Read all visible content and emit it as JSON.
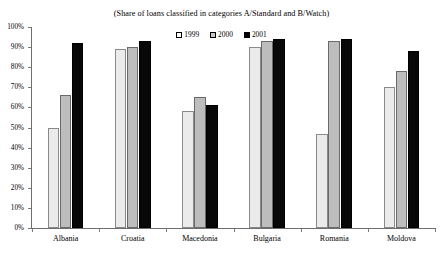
{
  "chart_data": {
    "type": "bar",
    "title": "(Share of loans classified in categories A/Standard and B/Watch)",
    "xlabel": "",
    "ylabel": "",
    "ylim": [
      0,
      100
    ],
    "ytick_labels": [
      "100%",
      "90%",
      "80%",
      "70%",
      "60%",
      "50%",
      "40%",
      "30%",
      "20%",
      "10%",
      "0%"
    ],
    "ytick_values": [
      100,
      90,
      80,
      70,
      60,
      50,
      40,
      30,
      20,
      10,
      0
    ],
    "grid": false,
    "legend_position": "top-center",
    "categories": [
      "Albania",
      "Croatia",
      "Macedonia",
      "Bulgaria",
      "Romania",
      "Moldova"
    ],
    "series": [
      {
        "name": "1999",
        "color": "#ebebeb",
        "values": [
          50,
          89,
          58,
          90,
          47,
          70
        ]
      },
      {
        "name": "2000",
        "color": "#bdbdbd",
        "values": [
          66,
          90,
          65,
          93,
          93,
          78
        ]
      },
      {
        "name": "2001",
        "color": "#080808",
        "values": [
          92,
          93,
          61,
          94,
          94,
          88
        ]
      }
    ]
  },
  "legend": {
    "entries": [
      {
        "label": "1999",
        "swatch": "white-square-icon"
      },
      {
        "label": "2000",
        "swatch": "gray-square-icon"
      },
      {
        "label": "2001",
        "swatch": "black-square-icon"
      }
    ]
  },
  "axis_colors": {
    "axis_line": "#6e6e6e",
    "text": "#000000",
    "background": "#ffffff"
  }
}
